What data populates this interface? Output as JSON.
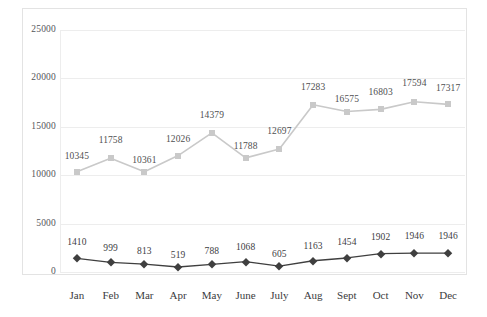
{
  "chart_data": {
    "type": "line",
    "title": "",
    "subtitle": "",
    "xlabel": "",
    "ylabel": "",
    "categories": [
      "Jan",
      "Feb",
      "Mar",
      "Apr",
      "May",
      "June",
      "July",
      "Aug",
      "Sept",
      "Oct",
      "Nov",
      "Dec"
    ],
    "ylim": [
      0,
      25000
    ],
    "ytick_labels": [
      "0",
      "5000",
      "10000",
      "15000",
      "20000",
      "25000"
    ],
    "ytick_values": [
      0,
      5000,
      10000,
      15000,
      20000,
      25000
    ],
    "grid": true,
    "legend": "none",
    "data_labels": true,
    "series": [
      {
        "name": "upper-series",
        "color": "#c9c9c9",
        "marker": "square",
        "values": [
          10345,
          11758,
          10361,
          12026,
          14379,
          11788,
          12697,
          17283,
          16575,
          16803,
          17594,
          17317
        ],
        "labels": [
          "10345",
          "11758",
          "10361",
          "12026",
          "14379",
          "11788",
          "12697",
          "17283",
          "16575",
          "16803",
          "17594",
          "17317"
        ]
      },
      {
        "name": "lower-series",
        "color": "#3f3f3f",
        "marker": "diamond",
        "values": [
          1410,
          999,
          813,
          519,
          788,
          1068,
          605,
          1163,
          1454,
          1902,
          1946,
          1946
        ],
        "labels": [
          "1410",
          "999",
          "813",
          "519",
          "788",
          "1068",
          "605",
          "1163",
          "1454",
          "1902",
          "1946",
          "1946"
        ]
      }
    ]
  },
  "colors": {
    "background": "#ffffff",
    "frame": "#e3e3e3",
    "gridline": "#ededed",
    "axis_text": "#55565a",
    "category_text": "#3b3b3d",
    "series_light": "#c9c9c9",
    "series_dark": "#3f3f3f"
  }
}
